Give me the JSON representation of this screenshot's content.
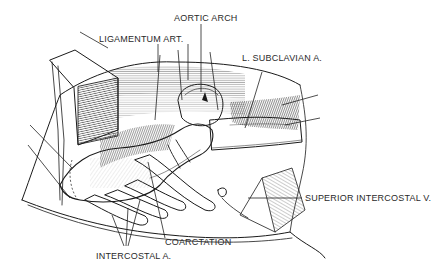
{
  "figure": {
    "labels": {
      "aortic_arch": "AORTIC ARCH",
      "ligamentum_art": "LIGAMENTUM ART.",
      "subclavian": "L. SUBCLAVIAN A.",
      "superior_intercostal": "SUPERIOR INTERCOSTAL V.",
      "coarctation": "COARCTATION",
      "intercostal": "INTERCOSTAL A."
    },
    "colors": {
      "ink": "#1a1a1a",
      "paper": "#ffffff",
      "label": "#2a2a2a"
    }
  }
}
